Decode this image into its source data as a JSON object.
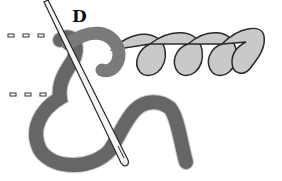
{
  "figure": {
    "label": "D",
    "colors": {
      "background": "#ffffff",
      "thread_dark": "#7a7a7a",
      "thread_light": "#c9c9c9",
      "outline": "#2a2a2a",
      "needle": "#f4f4f4"
    },
    "guide_lines": [
      {
        "name": "upper-guide-line",
        "y": 36
      },
      {
        "name": "lower-guide-line",
        "y": 95
      }
    ]
  }
}
